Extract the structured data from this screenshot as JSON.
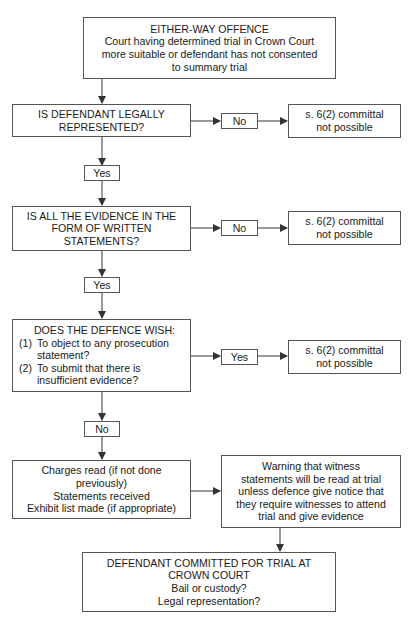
{
  "diagram": {
    "type": "flowchart",
    "start": {
      "title": "EITHER-WAY OFFENCE",
      "lines": [
        "Court having determined trial in Crown Court",
        "more suitable or defendant has not consented",
        "to summary trial"
      ]
    },
    "q1": {
      "lines": [
        "IS DEFENDANT LEGALLY",
        "REPRESENTED?"
      ],
      "no_label": "No",
      "yes_label": "Yes",
      "no_result": [
        "s. 6(2) committal",
        "not possible"
      ]
    },
    "q2": {
      "lines": [
        "IS ALL THE EVIDENCE IN THE",
        "FORM OF WRITTEN",
        "STATEMENTS?"
      ],
      "no_label": "No",
      "yes_label": "Yes",
      "no_result": [
        "s. 6(2) committal",
        "not possible"
      ]
    },
    "q3": {
      "title": "DOES THE DEFENCE WISH:",
      "items": [
        {
          "num": "(1)",
          "lines": [
            "To object to any prosecution",
            "statement?"
          ]
        },
        {
          "num": "(2)",
          "lines": [
            "To submit that there is",
            "insufficient evidence?"
          ]
        }
      ],
      "yes_label": "Yes",
      "no_label": "No",
      "yes_result": [
        "s. 6(2) committal",
        "not possible"
      ]
    },
    "steps": {
      "lines": [
        "Charges read (if not done",
        "previously)",
        "Statements received",
        "Exhibit list made (if appropriate)"
      ]
    },
    "warning": {
      "lines": [
        "Warning that witness",
        "statements will be read at trial",
        "unless defence give notice that",
        "they require witnesses to attend",
        "trial and give evidence"
      ]
    },
    "end": {
      "lines": [
        "DEFENDANT COMMITTED FOR TRIAL AT",
        "CROWN COURT",
        "Bail or custody?",
        "Legal representation?"
      ]
    },
    "colors": {
      "line": "#333333",
      "border": "#555555",
      "background": "#ffffff"
    }
  }
}
